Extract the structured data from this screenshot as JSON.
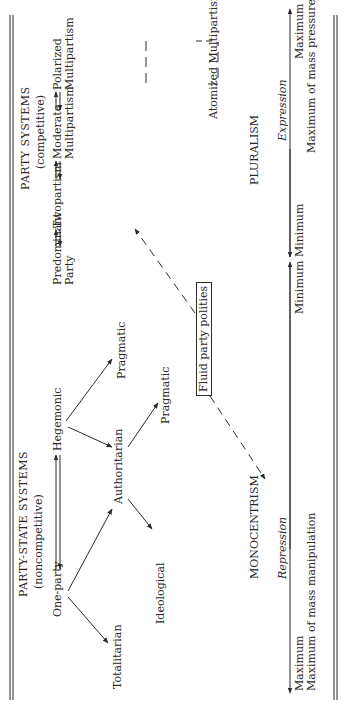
{
  "headings": {
    "party_state": "PARTY-STATE SYSTEMS",
    "party_state_sub": "(noncompetitive)",
    "party": "PARTY SYSTEMS",
    "party_sub": "(competitive)"
  },
  "nodes": {
    "one_party": "One-party",
    "hegemonic": "Hegemonic",
    "authoritarian": "Authoritarian",
    "totalitarian": "Totalitarian",
    "ideological": "Ideological",
    "pragmatic_upper": "Pragmatic",
    "pragmatic_lower": "Pragmatic",
    "predominant_1": "Predominant",
    "predominant_2": "Party",
    "twopartism": "Twopartism",
    "moderate_1": "Moderate",
    "moderate_2": "Multipartism",
    "polarized_1": "Polarized",
    "polarized_2": "Multipartism",
    "atomized": "Atomized Multipartism",
    "fluid": "Fluid party polities"
  },
  "regions": {
    "monocentrism": "MONOCENTRISM",
    "pluralism": "PLURALISM"
  },
  "scales": {
    "repression": {
      "label": "Repression",
      "left_1": "Maximum",
      "left_2": "Maximum of mass manipulation",
      "right": "Minimum"
    },
    "expression": {
      "label": "Expression",
      "left": "Minimum",
      "right_1": "Maximum",
      "right_2": "Maximum of mass pressure"
    }
  },
  "colors": {
    "ink": "#2a2a2a",
    "background": "#ffffff"
  }
}
